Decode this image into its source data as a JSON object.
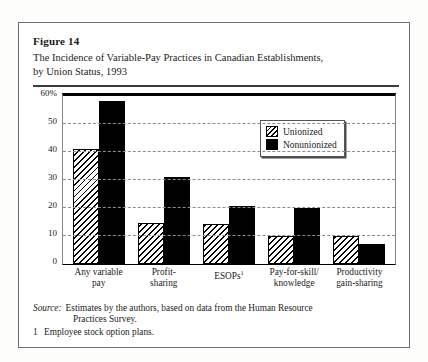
{
  "figure": {
    "label": "Figure 14",
    "title_line1": "The Incidence of Variable-Pay Practices in Canadian Establishments,",
    "title_line2": "by Union Status, 1993"
  },
  "source": {
    "label": "Source:",
    "line1": "Estimates by the authors, based on data from the Human Resource",
    "line2": "Practices Survey."
  },
  "footnote": {
    "number": "1",
    "text": "Employee stock option plans."
  },
  "chart_data": {
    "type": "bar",
    "title": "The Incidence of Variable-Pay Practices in Canadian Establishments, by Union Status, 1993",
    "xlabel": "",
    "ylabel": "",
    "ylim": [
      0,
      60
    ],
    "grid": true,
    "legend_position": "top-right",
    "yticks": [
      "60%",
      "50",
      "40",
      "30",
      "20",
      "10",
      "0"
    ],
    "ytick_values": [
      60,
      50,
      40,
      30,
      20,
      10,
      0
    ],
    "categories": [
      "Any variable pay",
      "Profit-sharing",
      "ESOPs",
      "Pay-for-skill/ knowledge",
      "Productivity gain-sharing"
    ],
    "category_lines": [
      [
        "Any variable",
        "pay"
      ],
      [
        "Profit-",
        "sharing"
      ],
      [
        "ESOPs",
        ""
      ],
      [
        "Pay-for-skill/",
        "knowledge"
      ],
      [
        "Productivity",
        "gain-sharing"
      ]
    ],
    "series": [
      {
        "name": "Unionized",
        "values": [
          41,
          14.5,
          14,
          10,
          10
        ]
      },
      {
        "name": "Nonunionized",
        "values": [
          58,
          31,
          20.5,
          20,
          7
        ]
      }
    ]
  },
  "colors": {
    "ink": "#000000",
    "frame": "#6e6e6e",
    "grid": "#8c8c8c"
  }
}
